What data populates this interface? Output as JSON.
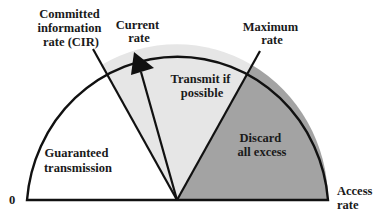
{
  "diagram": {
    "type": "semicircle-rate-gauge",
    "colors": {
      "guaranteed_fill": "#ffffff",
      "transmit_fill": "#e6e6e6",
      "discard_fill": "#a3a3a3",
      "stroke": "#111111"
    },
    "labels": {
      "cir": [
        "Committed",
        "information",
        "rate (CIR)"
      ],
      "current": [
        "Current",
        "rate"
      ],
      "maximum": [
        "Maximum",
        "rate"
      ],
      "transmit": [
        "Transmit if",
        "possible"
      ],
      "guaranteed": [
        "Guaranteed",
        "transmission"
      ],
      "discard": [
        "Discard",
        "all excess"
      ],
      "access": [
        "Access",
        "rate"
      ],
      "zero": "0"
    }
  }
}
